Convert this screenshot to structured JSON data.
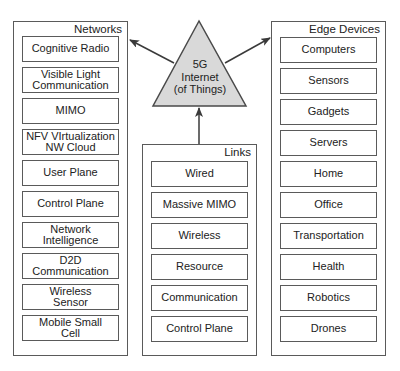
{
  "center": {
    "shape": "triangle",
    "fill": "#d9d9d9",
    "lines": [
      "5G",
      "Internet",
      "(of Things)"
    ]
  },
  "groups": {
    "networks": {
      "title": "Networks",
      "items": [
        "Cognitive Radio",
        "Visible Light\nCommunication",
        "MIMO",
        "NFV VIrtualization\nNW Cloud",
        "User Plane",
        "Control Plane",
        "Network\nIntelligence",
        "D2D\nCommunication",
        "Wireless\nSensor",
        "Mobile Small\nCell"
      ]
    },
    "links": {
      "title": "Links",
      "items": [
        "Wired",
        "Massive MIMO",
        "Wireless",
        "Resource",
        "Communication",
        "Control Plane"
      ]
    },
    "edge_devices": {
      "title": "Edge Devices",
      "items": [
        "Computers",
        "Sensors",
        "Gadgets",
        "Servers",
        "Home",
        "Office",
        "Transportation",
        "Health",
        "Robotics",
        "Drones"
      ]
    }
  },
  "arrows": [
    {
      "from": "center",
      "to": "networks"
    },
    {
      "from": "center",
      "to": "edge_devices"
    },
    {
      "from": "links",
      "to": "center"
    }
  ],
  "colors": {
    "border": "#5a5a5a",
    "triangle_fill": "#d9d9d9",
    "background": "#ffffff"
  }
}
